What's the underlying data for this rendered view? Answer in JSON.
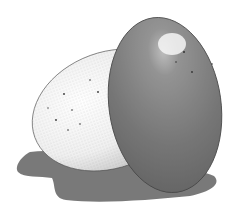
{
  "image": {
    "subject": "Stippled ink illustration of two eggs, one pale and one dark, with a gray shadow",
    "colors": {
      "background": "#ffffff",
      "shadow": "#6a6a6a",
      "light_egg": "#f2f2f2",
      "dark_egg": "#7a7a7a",
      "highlight": "#f4f4f4",
      "outline": "#3a3a3a"
    }
  }
}
